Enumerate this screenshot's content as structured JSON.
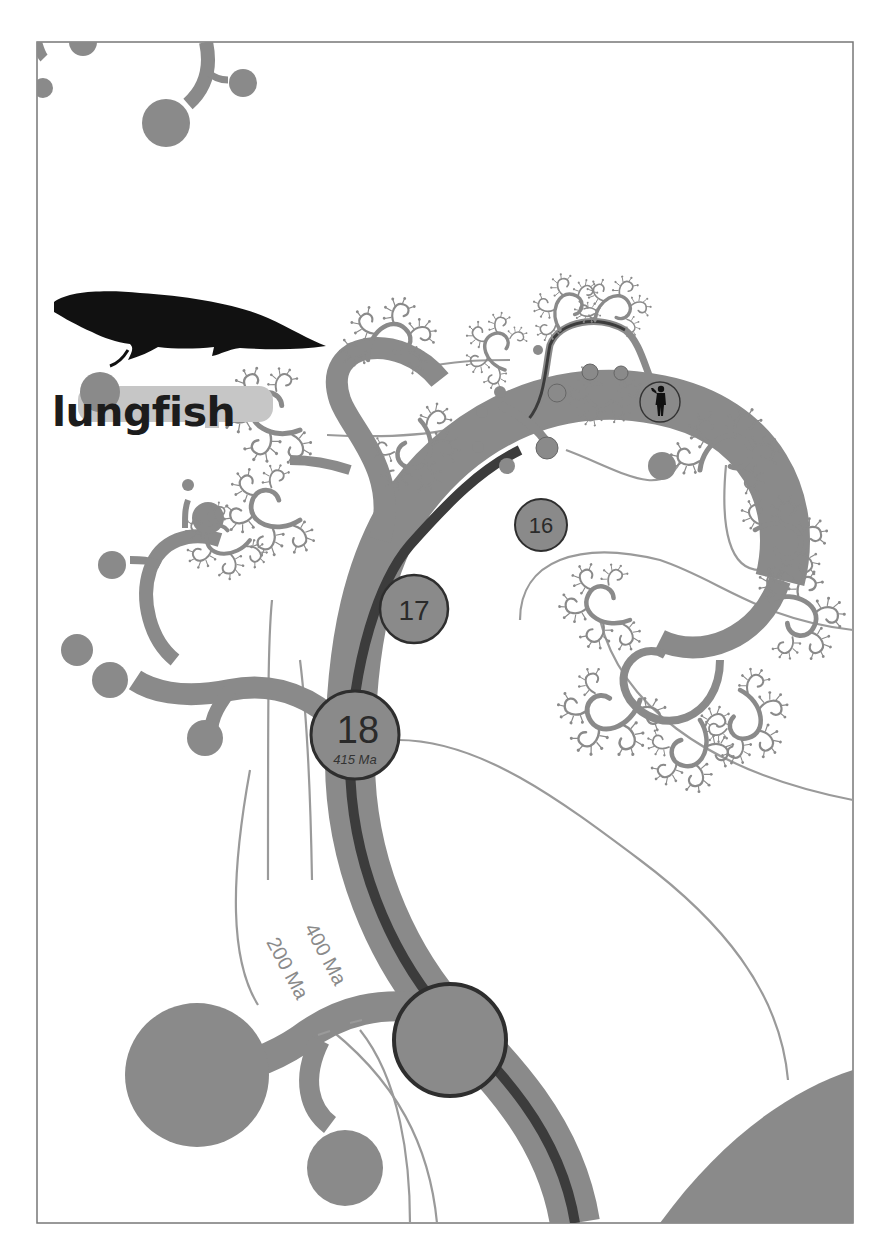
{
  "diagram": {
    "type": "phylogenetic-tree-illustration",
    "colors": {
      "branch": "#8a8a8a",
      "human_lineage": "#3c3c3c",
      "time_contour": "#9a9a9a",
      "node_outline": "#2e2e2e",
      "frame": "#777777",
      "silhouette": "#111111",
      "background": "#ffffff"
    },
    "label": "lungfish",
    "nodes": [
      {
        "id": "node-16",
        "number": "16",
        "date": ""
      },
      {
        "id": "node-17",
        "number": "17",
        "date": ""
      },
      {
        "id": "node-18",
        "number": "18",
        "date": "415 Ma"
      },
      {
        "id": "node-19",
        "number": "",
        "date": ""
      }
    ],
    "time_contours": [
      {
        "label": "400 Ma"
      },
      {
        "label": "200 Ma"
      }
    ],
    "icons": {
      "fish": "lungfish-silhouette-icon",
      "human": "human-silhouette-icon"
    }
  }
}
